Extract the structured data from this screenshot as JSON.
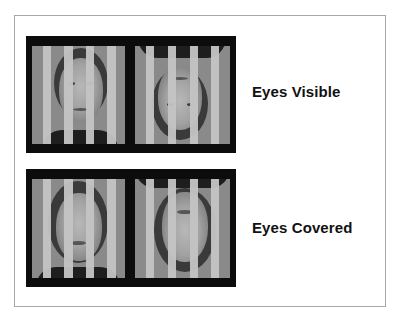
{
  "figure": {
    "rows": [
      {
        "label": "Eyes Visible",
        "images": [
          {
            "orientation": "upright",
            "description": "face behind vertical bars, eyes visible"
          },
          {
            "orientation": "inverted",
            "description": "inverted face behind vertical bars, eyes visible"
          }
        ]
      },
      {
        "label": "Eyes Covered",
        "images": [
          {
            "orientation": "upright",
            "description": "face behind vertical bars, eyes covered by bars"
          },
          {
            "orientation": "inverted",
            "description": "inverted face behind vertical bars, eyes covered by bars"
          }
        ]
      }
    ],
    "colors": {
      "panel_background": "#0c0c0c",
      "bar_color": "#c4c4c4",
      "image_background": "#8a8a8a",
      "frame_border": "#a9a9a9",
      "label_color": "#111111"
    }
  }
}
